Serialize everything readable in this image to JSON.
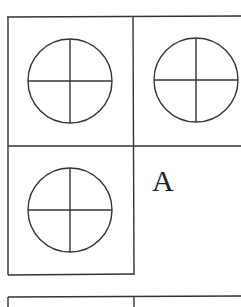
{
  "diagram": {
    "cells": [
      {
        "id": "top-left",
        "symbol": "circle-cross"
      },
      {
        "id": "top-right",
        "symbol": "circle-cross"
      },
      {
        "id": "bottom-left",
        "symbol": "circle-cross"
      },
      {
        "id": "bottom-right",
        "label": "A"
      }
    ],
    "line_color": "#333333"
  }
}
